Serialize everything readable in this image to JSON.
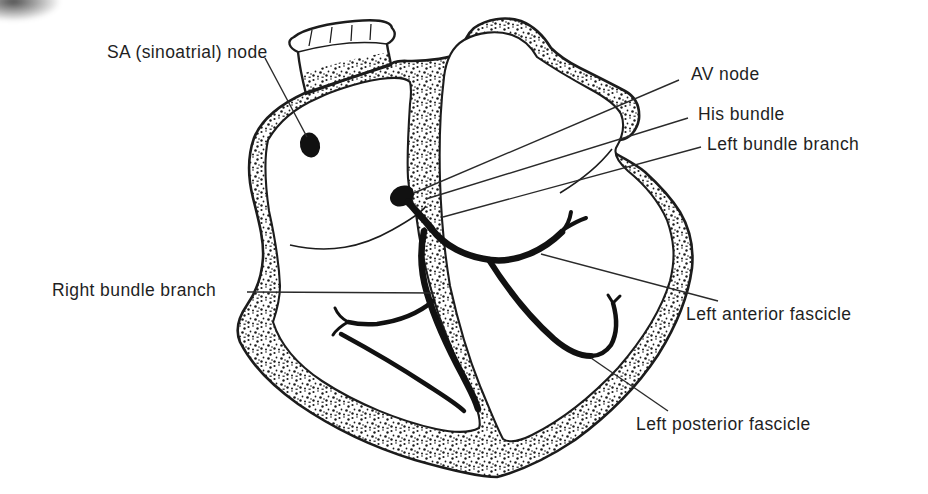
{
  "figure": {
    "type": "anatomical-diagram",
    "background_color": "#ffffff",
    "ink_color": "#1c1c1c",
    "labels": [
      {
        "id": "sa-node",
        "text": "SA (sinoatrial) node"
      },
      {
        "id": "av-node",
        "text": "AV node"
      },
      {
        "id": "his-bundle",
        "text": "His bundle"
      },
      {
        "id": "left-bundle-branch",
        "text": "Left bundle branch"
      },
      {
        "id": "left-anterior-fascicle",
        "text": "Left anterior fascicle"
      },
      {
        "id": "left-posterior-fascicle",
        "text": "Left posterior fascicle"
      },
      {
        "id": "right-bundle-branch",
        "text": "Right bundle branch"
      }
    ]
  }
}
